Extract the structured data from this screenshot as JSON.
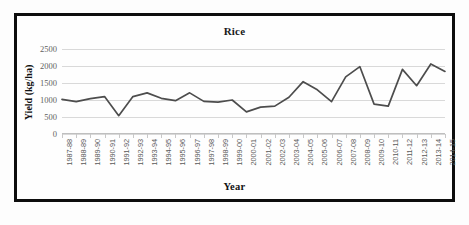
{
  "chart_data": {
    "type": "line",
    "title": "Rice",
    "xlabel": "Year",
    "ylabel": "Yield (kg/ha)",
    "ylim": [
      0,
      2500
    ],
    "yticks": [
      0,
      500,
      1000,
      1500,
      2000,
      2500
    ],
    "ytick_labels": [
      "0",
      "500",
      "1000",
      "1500",
      "2000",
      "2500"
    ],
    "grid": true,
    "legend": false,
    "line_color": "#4d4d4d",
    "categories": [
      "1987-88",
      "1988-89",
      "1989-90",
      "1990-91",
      "1991-92",
      "1992-93",
      "1993-94",
      "1994-95",
      "1995-96",
      "1996-97",
      "1997-98",
      "1998-99",
      "1999-00",
      "2000-01",
      "2001-02",
      "2002-03",
      "2003-04",
      "2004-05",
      "2005-06",
      "2006-07",
      "2007-08",
      "2008-09",
      "2009-10",
      "2010-11",
      "2011-12",
      "2012-13",
      "2013-14",
      "2014-15"
    ],
    "values": [
      1020,
      950,
      1040,
      1100,
      540,
      1100,
      1210,
      1050,
      980,
      1210,
      960,
      940,
      1000,
      650,
      790,
      820,
      1080,
      1540,
      1300,
      950,
      1680,
      1980,
      880,
      820,
      1900,
      1420,
      2060,
      1840
    ],
    "series": [
      {
        "name": "Rice",
        "values": [
          1020,
          950,
          1040,
          1100,
          540,
          1100,
          1210,
          1050,
          980,
          1210,
          960,
          940,
          1000,
          650,
          790,
          820,
          1080,
          1540,
          1300,
          950,
          1680,
          1980,
          880,
          820,
          1900,
          1420,
          2060,
          1840
        ]
      }
    ]
  }
}
